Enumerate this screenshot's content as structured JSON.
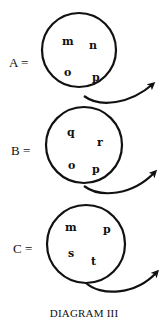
{
  "diagram": {
    "caption": "DIAGRAM III",
    "stroke_color": "#111111",
    "sets": [
      {
        "label": "A =",
        "elements": [
          "m",
          "n",
          "o",
          "p"
        ]
      },
      {
        "label": "B =",
        "elements": [
          "q",
          "r",
          "o",
          "p"
        ]
      },
      {
        "label": "C =",
        "elements": [
          "m",
          "p",
          "s",
          "t"
        ]
      }
    ],
    "icons": {
      "arrow": "curved-arrow-icon"
    }
  }
}
